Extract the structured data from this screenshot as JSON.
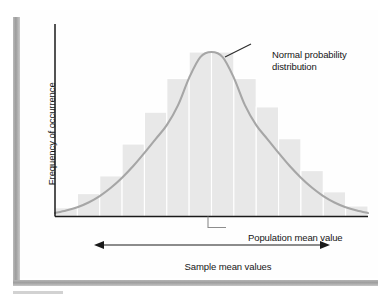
{
  "figure": {
    "background_color": "#ffffff",
    "panel_color": "#fefefe",
    "rail_color": "#a0a0a0"
  },
  "labels": {
    "y_axis": "Frequency of occurrence",
    "curve_annotation": "Normal probability distribution",
    "mean_annotation": "Population mean value",
    "x_axis_span": "Sample mean values"
  },
  "chart_data": {
    "type": "bar",
    "title": "",
    "subtitle": "",
    "xlabel": "Sample mean values",
    "ylabel": "Frequency of occurrence",
    "grid": false,
    "legend": false,
    "axis_ticks": false,
    "xlim": [
      -3.5,
      3.5
    ],
    "ylim": [
      0,
      1.05
    ],
    "bar_color": "#e8e8e8",
    "bar_edge_color": "#ffffff",
    "curve_color": "#a6a6a6",
    "categories": [
      "-3.25",
      "-2.75",
      "-2.25",
      "-1.75",
      "-1.25",
      "-0.75",
      "-0.25",
      "0.25",
      "0.75",
      "1.25",
      "1.75",
      "2.25",
      "2.75",
      "3.25"
    ],
    "values": [
      0.05,
      0.13,
      0.23,
      0.41,
      0.59,
      0.78,
      0.93,
      0.93,
      0.78,
      0.62,
      0.44,
      0.26,
      0.14,
      0.06
    ],
    "series": [
      {
        "name": "Sample mean frequency histogram",
        "values": [
          0.05,
          0.13,
          0.23,
          0.41,
          0.59,
          0.78,
          0.93,
          0.93,
          0.78,
          0.62,
          0.44,
          0.26,
          0.14,
          0.06
        ]
      },
      {
        "name": "Normal probability distribution",
        "type": "line",
        "x": [
          -3.5,
          -3.25,
          -3.0,
          -2.75,
          -2.5,
          -2.25,
          -2.0,
          -1.75,
          -1.5,
          -1.25,
          -1.0,
          -0.75,
          -0.5,
          -0.25,
          0.0,
          0.25,
          0.5,
          0.75,
          1.0,
          1.25,
          1.5,
          1.75,
          2.0,
          2.25,
          2.5,
          2.75,
          3.0,
          3.25,
          3.5
        ],
        "values": [
          0.022,
          0.037,
          0.057,
          0.086,
          0.125,
          0.175,
          0.236,
          0.307,
          0.387,
          0.471,
          0.556,
          0.676,
          0.843,
          0.969,
          1.0,
          0.969,
          0.843,
          0.676,
          0.556,
          0.471,
          0.387,
          0.307,
          0.236,
          0.175,
          0.125,
          0.086,
          0.057,
          0.037,
          0.022
        ]
      }
    ],
    "annotations": [
      {
        "text": "Normal probability distribution",
        "target": "curve-right-shoulder"
      },
      {
        "text": "Population mean value",
        "target": "x-axis-center"
      },
      {
        "text": "Sample mean values",
        "target": "double-arrow-span"
      }
    ]
  }
}
